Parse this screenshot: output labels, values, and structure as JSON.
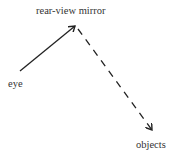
{
  "diagram": {
    "nodes": [
      {
        "id": "mirror",
        "label": "rear-view mirror"
      },
      {
        "id": "eye",
        "label": "eye"
      },
      {
        "id": "objects",
        "label": "objects"
      }
    ],
    "edges": [
      {
        "from": "eye",
        "to": "mirror",
        "style": "solid"
      },
      {
        "from": "mirror",
        "to": "objects",
        "style": "dashed"
      }
    ]
  }
}
